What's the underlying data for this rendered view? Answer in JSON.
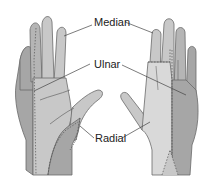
{
  "figure": {
    "labels": {
      "median": "Median",
      "ulnar": "Ulnar",
      "radial": "Radial"
    },
    "colors": {
      "median": "#c8c8c8",
      "ulnar": "#a6a6a6",
      "radial": "#d9d9d9",
      "outline": "#6a6a6a",
      "dash": "#555555",
      "leader": "#444444"
    },
    "views": [
      "palmar",
      "dorsal"
    ]
  }
}
